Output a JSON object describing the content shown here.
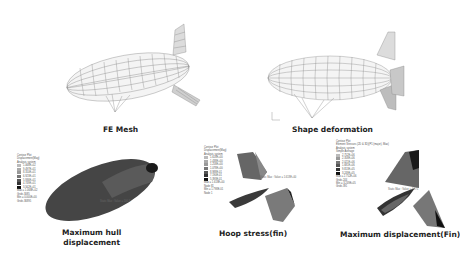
{
  "figure": {
    "panels": [
      {
        "id": "fe-mesh",
        "caption": "FE Mesh"
      },
      {
        "id": "shape-deformation",
        "caption": "Shape deformation"
      },
      {
        "id": "max-hull-displacement",
        "caption_line1": "Maximum hull",
        "caption_line2": "displacement",
        "legend": {
          "title": [
            "Contour Plot",
            "Displacement(Mag)",
            "Analysis system"
          ],
          "values": [
            "1.068E+02",
            "9.497E+01",
            "8.310E+01",
            "6.923E+01",
            "5.936E+01",
            "4.749E+01",
            "3.562E+01"
          ],
          "footer": [
            "Max = 1.068E+02",
            "Grids 3085",
            "Min = 0.000E+00",
            "Grids 36895"
          ]
        },
        "annotation": "Static Max : Value = 106.8"
      },
      {
        "id": "hoop-stress-fin",
        "caption": "Hoop stress(fin)",
        "legend": {
          "title": [
            "Contour Plot",
            "Displacement(Mag)",
            "Analysis system"
          ],
          "values": [
            "1.618E+00",
            "1.438E+00",
            "1.258E+00",
            "1.078E+00",
            "8.988E-01",
            "7.190E-01",
            "5.393E-01"
          ],
          "footer": [
            "Max = 1.618E+00",
            "Node 81",
            "Min = 1.798E-01",
            "Node 1"
          ]
        },
        "annotation": "Static Max : Value = 1.618E+00"
      },
      {
        "id": "max-displacement-fin",
        "caption": "Maximum displacement(Fin)",
        "legend": {
          "title": [
            "Contour Plot",
            "Element Stresses (2D & 3D)(P1 (major), Max)",
            "Analysis system",
            "Simple Average"
          ],
          "values": [
            "2.752E+06",
            "2.358E+06",
            "2.021E+06",
            "1.681E+06",
            "9.813E+05",
            "3.249E+05"
          ],
          "footer": [
            "Max = 2.752E+06",
            "Grids 244",
            "Min = 3.249E+05",
            "Grids 391"
          ]
        },
        "annotation": "Static Max : Value = 4.375"
      }
    ],
    "colors": {
      "mesh": "#8a8a8a",
      "hull_dark": "#2e2e2e",
      "hull_mid": "#4d4d4d",
      "fin_light": "#7a7a7a",
      "caption": "#222222"
    }
  }
}
